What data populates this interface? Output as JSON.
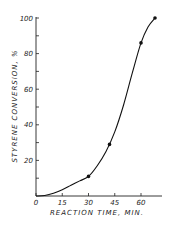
{
  "chart_data": {
    "type": "line",
    "title": "",
    "xlabel": "REACTION TIME, MIN.",
    "ylabel": "STYRENE CONVERSION, %",
    "xlim": [
      0,
      70
    ],
    "ylim": [
      0,
      100
    ],
    "x_ticks": [
      "0",
      "15",
      "30",
      "45",
      "60"
    ],
    "y_ticks": [
      "20",
      "40",
      "60",
      "80",
      "100"
    ],
    "grid": false,
    "legend": null,
    "series": [
      {
        "name": "Experimental points",
        "kind": "scatter",
        "x": [
          30,
          42,
          60,
          68
        ],
        "y": [
          11,
          29,
          86,
          100
        ]
      },
      {
        "name": "Fitted curve",
        "kind": "line",
        "x": [
          0,
          5,
          10,
          15,
          20,
          25,
          30,
          35,
          40,
          45,
          50,
          55,
          60,
          64,
          68
        ],
        "y": [
          0,
          0.3,
          1.5,
          3.5,
          6,
          8.5,
          11,
          17,
          25,
          36,
          51,
          69,
          86,
          95,
          100
        ]
      }
    ]
  }
}
